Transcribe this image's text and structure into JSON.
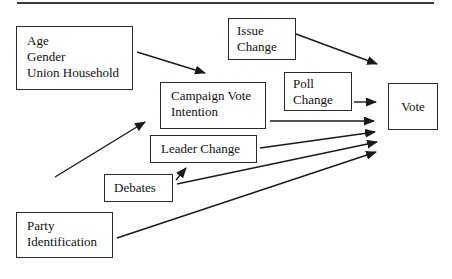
{
  "figure": {
    "colors": {
      "line": "#1a1a1a",
      "box_border": "#2a2a2a",
      "background": "#ffffff",
      "top_rule": "#3a3a3a"
    },
    "nodes": {
      "demographics": {
        "lines": [
          "Age",
          "Gender",
          "Union Household"
        ]
      },
      "issue_change": {
        "lines": [
          "Issue",
          "Change"
        ]
      },
      "poll_change": {
        "lines": [
          "Poll",
          "Change"
        ]
      },
      "campaign_vote_intention": {
        "lines": [
          "Campaign Vote",
          "Intention"
        ]
      },
      "leader_change": {
        "lines": [
          "Leader Change"
        ]
      },
      "debates": {
        "lines": [
          "Debates"
        ]
      },
      "party_identification": {
        "lines": [
          "Party",
          "Identification"
        ]
      },
      "vote": {
        "lines": [
          "Vote"
        ]
      }
    },
    "edges": [
      {
        "from": "demographics",
        "to": "campaign_vote_intention"
      },
      {
        "from": "unlabeled-lower-left",
        "to": "campaign_vote_intention"
      },
      {
        "from": "issue_change",
        "to": "vote"
      },
      {
        "from": "poll_change",
        "to": "vote"
      },
      {
        "from": "campaign_vote_intention",
        "to": "vote"
      },
      {
        "from": "leader_change",
        "to": "vote"
      },
      {
        "from": "debates",
        "to": "leader_change"
      },
      {
        "from": "debates",
        "to": "vote"
      },
      {
        "from": "party_identification",
        "to": "vote"
      }
    ]
  }
}
